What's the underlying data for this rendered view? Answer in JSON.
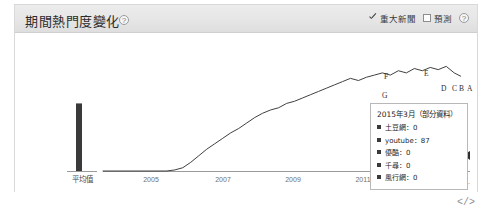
{
  "panel": {
    "title": "期間熱門度變化",
    "title_info_icon": "info-circle-icon"
  },
  "header_controls": [
    {
      "label": "重大新聞",
      "checked": true,
      "icon": "checkbox-checked-icon"
    },
    {
      "label": "預測",
      "checked": false,
      "icon": "checkbox-unchecked-icon"
    }
  ],
  "header_info_icon": "info-circle-icon",
  "tooltip": {
    "title": "2015年3月（部分資料）",
    "rows": [
      {
        "name": "土豆網",
        "value": "0",
        "text": "土豆網：0"
      },
      {
        "name": "youtube",
        "value": "87",
        "text": "youtube：87"
      },
      {
        "name": "優酷",
        "value": "0",
        "text": "優酷：0"
      },
      {
        "name": "千尋",
        "value": "0",
        "text": "千尋：0"
      },
      {
        "name": "風行網",
        "value": "0",
        "text": "風行網：0"
      }
    ]
  },
  "embed_icon_label": "</>",
  "chart_data": {
    "type": "line",
    "title": "期間熱門度變化",
    "xlabel": "",
    "ylabel": "",
    "grid": false,
    "legend_position": "none",
    "average_bar": {
      "label": "平均值",
      "value": 62,
      "color": "#3a3a3a"
    },
    "series": [
      {
        "name": "youtube",
        "color": "#404040",
        "x": [
          2004.0,
          2004.25,
          2004.5,
          2004.75,
          2005.0,
          2005.25,
          2005.5,
          2005.75,
          2006.0,
          2006.25,
          2006.5,
          2006.75,
          2007.0,
          2007.25,
          2007.5,
          2007.75,
          2008.0,
          2008.25,
          2008.5,
          2008.75,
          2009.0,
          2009.25,
          2009.5,
          2009.75,
          2010.0,
          2010.25,
          2010.5,
          2010.75,
          2011.0,
          2011.25,
          2011.5,
          2011.75,
          2012.0,
          2012.25,
          2012.5,
          2012.75,
          2013.0,
          2013.25,
          2013.5,
          2013.75,
          2014.0,
          2014.25,
          2014.5,
          2014.75,
          2015.0,
          2015.2
        ],
        "values": [
          0,
          0,
          0,
          0,
          0,
          0,
          0,
          0,
          0,
          1,
          3,
          8,
          14,
          20,
          25,
          30,
          35,
          39,
          44,
          49,
          53,
          56,
          58,
          62,
          64,
          67,
          70,
          73,
          76,
          79,
          82,
          85,
          83,
          86,
          88,
          90,
          88,
          92,
          90,
          94,
          92,
          95,
          93,
          96,
          90,
          87
        ]
      }
    ],
    "x_ticks": [
      {
        "label": "平均值",
        "type": "average"
      },
      {
        "label": "2005",
        "type": "year"
      },
      {
        "label": "2007",
        "type": "year"
      },
      {
        "label": "2009",
        "type": "year"
      },
      {
        "label": "2011",
        "type": "year"
      },
      {
        "label": "2...",
        "type": "year-truncated"
      }
    ],
    "annotations": [
      {
        "label": "G",
        "x": 2013.1,
        "y": 70
      },
      {
        "label": "F",
        "x": 2013.3,
        "y": 92
      },
      {
        "label": "E",
        "x": 2014.0,
        "y": 92
      },
      {
        "label": "D",
        "x": 2014.45,
        "y": 78
      },
      {
        "label": "C",
        "x": 2014.65,
        "y": 78
      },
      {
        "label": "B",
        "x": 2014.78,
        "y": 78
      },
      {
        "label": "A",
        "x": 2014.95,
        "y": 78
      }
    ],
    "ylim": [
      0,
      100
    ],
    "xlim": [
      2004,
      2015.4
    ]
  }
}
